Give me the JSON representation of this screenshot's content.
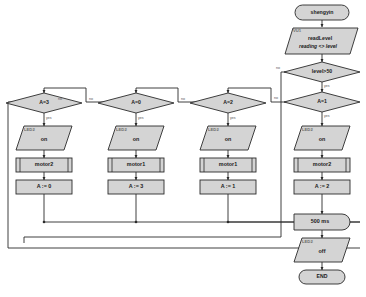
{
  "diagram": {
    "colors": {
      "node_fill": "#d4d4d4",
      "node_stroke": "#1c1c1c",
      "connector": "#2a2a2a",
      "page_background": "#ffffff",
      "tag_text": "#6b6b6b",
      "edge_label_text": "#555555"
    },
    "nodes": {
      "start": {
        "label": "shengyin",
        "shape": "terminator"
      },
      "read_input": {
        "tag": "VU1",
        "line1": "readLevel",
        "line2": "reading <> level",
        "shape": "parallelogram-input"
      },
      "decision_level": {
        "label": "level>50",
        "shape": "diamond"
      },
      "decision_a1": {
        "label": "A=1",
        "shape": "diamond"
      },
      "decision_a2": {
        "label": "A=2",
        "shape": "diamond"
      },
      "decision_a0": {
        "label": "A=0",
        "shape": "diamond"
      },
      "decision_a3": {
        "label": "A=3",
        "shape": "diamond"
      },
      "led_col1": {
        "tag": "LED2",
        "label": "on",
        "shape": "parallelogram-output"
      },
      "led_col2": {
        "tag": "LED2",
        "label": "on",
        "shape": "parallelogram-output"
      },
      "led_col3": {
        "tag": "LED2",
        "label": "on",
        "shape": "parallelogram-output"
      },
      "led_col4": {
        "tag": "LED2",
        "label": "on",
        "shape": "parallelogram-output"
      },
      "motor_col1": {
        "label": "motor2",
        "shape": "subroutine"
      },
      "motor_col2": {
        "label": "motor1",
        "shape": "subroutine"
      },
      "motor_col3": {
        "label": "motor1",
        "shape": "subroutine"
      },
      "motor_col4": {
        "label": "motor2",
        "shape": "subroutine"
      },
      "assign_col1": {
        "label": "A := 0",
        "shape": "process"
      },
      "assign_col2": {
        "label": "A := 3",
        "shape": "process"
      },
      "assign_col3": {
        "label": "A := 1",
        "shape": "process"
      },
      "assign_col4": {
        "label": "A := 2",
        "shape": "process"
      },
      "delay": {
        "label": "500 ms",
        "shape": "delay"
      },
      "led_off": {
        "tag": "LED2",
        "label": "off",
        "shape": "parallelogram-output"
      },
      "end": {
        "label": "END",
        "shape": "terminator"
      }
    },
    "edge_labels": {
      "level_no": "no",
      "level_yes": "yes",
      "a1_no": "no",
      "a1_yes": "yes",
      "a2_no": "no",
      "a2_yes": "yes",
      "a0_no": "no",
      "a0_yes": "yes",
      "a3_no": "no",
      "a3_yes": "yes"
    }
  }
}
